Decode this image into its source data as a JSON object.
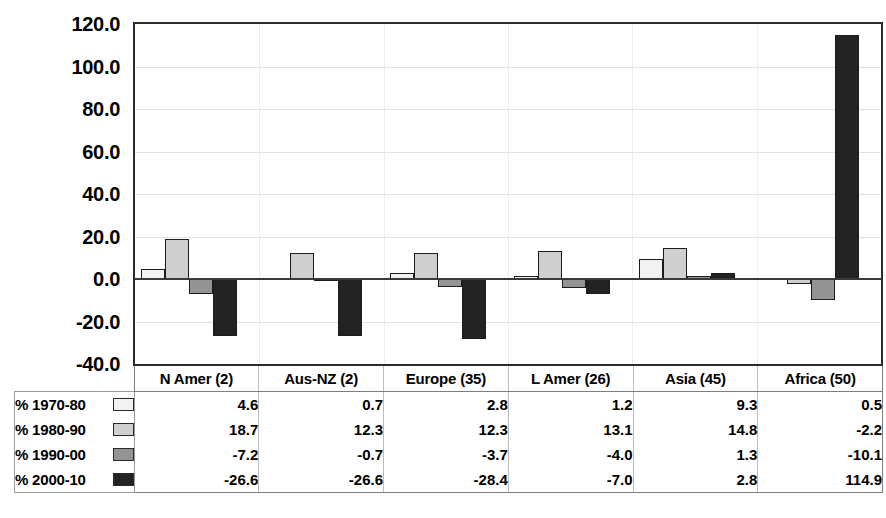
{
  "chart_data": {
    "type": "bar",
    "title": "",
    "xlabel": "",
    "ylabel": "",
    "ylim": [
      -40.0,
      120.0
    ],
    "ytick_step": 20.0,
    "yticks": [
      "120.0",
      "100.0",
      "80.0",
      "60.0",
      "40.0",
      "20.0",
      "0.0",
      "-20.0",
      "-40.0"
    ],
    "grid": true,
    "legend_position": "table-row-labels",
    "categories": [
      "N Amer (2)",
      "Aus-NZ (2)",
      "Europe (35)",
      "L Amer (26)",
      "Asia (45)",
      "Africa (50)"
    ],
    "series": [
      {
        "name": "% 1970-80",
        "color": "#f2f2f2",
        "values": [
          4.6,
          0.7,
          2.8,
          1.2,
          9.3,
          0.5
        ]
      },
      {
        "name": "% 1980-90",
        "color": "#cfcfcf",
        "values": [
          18.7,
          12.3,
          12.3,
          13.1,
          14.8,
          -2.2
        ]
      },
      {
        "name": "% 1990-00",
        "color": "#949494",
        "values": [
          -7.2,
          -0.7,
          -3.7,
          -4.0,
          1.3,
          -10.1
        ]
      },
      {
        "name": "% 2000-10",
        "color": "#232323",
        "values": [
          -26.6,
          -26.6,
          -28.4,
          -7.0,
          2.8,
          114.9
        ]
      }
    ]
  },
  "table": {
    "corner": "",
    "headers": [
      "N Amer (2)",
      "Aus-NZ (2)",
      "Europe (35)",
      "L Amer (26)",
      "Asia (45)",
      "Africa (50)"
    ],
    "rows": [
      {
        "label": "% 1970-80",
        "swatch": "#f2f2f2",
        "values": [
          "4.6",
          "0.7",
          "2.8",
          "1.2",
          "9.3",
          "0.5"
        ]
      },
      {
        "label": "% 1980-90",
        "swatch": "#cfcfcf",
        "values": [
          "18.7",
          "12.3",
          "12.3",
          "13.1",
          "14.8",
          "-2.2"
        ]
      },
      {
        "label": "% 1990-00",
        "swatch": "#949494",
        "values": [
          "-7.2",
          "-0.7",
          "-3.7",
          "-4.0",
          "1.3",
          "-10.1"
        ]
      },
      {
        "label": "% 2000-10",
        "swatch": "#232323",
        "values": [
          "-26.6",
          "-26.6",
          "-28.4",
          "-7.0",
          "2.8",
          "114.9"
        ]
      }
    ]
  }
}
